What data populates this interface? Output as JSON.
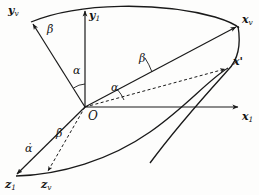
{
  "figure": {
    "kind": "rotation-axes-diagram",
    "background_color": "#fdfdfc",
    "line_color": "#1a1a1a",
    "origin": {
      "label": "O",
      "x": 85,
      "y": 107
    }
  },
  "axes": [
    {
      "id": "y-v",
      "name": "y_v",
      "base": "y",
      "subscript": "v",
      "label_x": 8,
      "label_y": 7,
      "tip_x": 33,
      "tip_y": 24,
      "style": "solid"
    },
    {
      "id": "y-1",
      "name": "y_1",
      "base": "y",
      "subscript": "1",
      "label_x": 90,
      "label_y": 10,
      "tip_x": 85,
      "tip_y": 9,
      "style": "solid"
    },
    {
      "id": "x-v",
      "name": "x_v",
      "base": "x",
      "subscript": "v",
      "label_x": 243,
      "label_y": 15,
      "tip_x": 238,
      "tip_y": 25,
      "style": "solid"
    },
    {
      "id": "x-1",
      "name": "x_1",
      "base": "x",
      "subscript": "1",
      "label_x": 243,
      "label_y": 112,
      "tip_x": 240,
      "tip_y": 107,
      "style": "solid"
    },
    {
      "id": "z-1",
      "name": "z_1",
      "base": "z",
      "subscript": "1",
      "label_x": 6,
      "label_y": 180,
      "tip_x": 15,
      "tip_y": 175,
      "style": "solid"
    },
    {
      "id": "z-v",
      "name": "z_v",
      "base": "z",
      "subscript": "v",
      "label_x": 41,
      "label_y": 180,
      "tip_x": 48,
      "tip_y": 174,
      "style": "dashed"
    }
  ],
  "points": [
    {
      "id": "x-prime",
      "name": "x'",
      "base": "x",
      "accent": "'",
      "label_x": 234,
      "label_y": 58,
      "tip_x": 228,
      "tip_y": 68
    }
  ],
  "angles": [
    {
      "id": "alpha-upper",
      "symbol": "α",
      "label_x": 74,
      "label_y": 68,
      "between": [
        "y_v",
        "y_1"
      ]
    },
    {
      "id": "beta-mid",
      "symbol": "β",
      "label_x": 140,
      "label_y": 58,
      "between": [
        "x-prime-line",
        "x_1-dashed"
      ]
    },
    {
      "id": "alpha-lower",
      "symbol": "α",
      "label_x": 112,
      "label_y": 86,
      "between": [
        "x_1-dashed",
        "x_1"
      ]
    }
  ],
  "rates": [
    {
      "id": "beta-dot-upper",
      "symbol": "β̇",
      "base": "β",
      "label_x": 48,
      "label_y": 26,
      "on_axis": "y_v"
    },
    {
      "id": "alpha-dot-lower",
      "symbol": "α̇",
      "base": "α",
      "label_x": 26,
      "label_y": 145,
      "on_axis": "z_1"
    },
    {
      "id": "beta-dot-lower",
      "symbol": "β̇",
      "base": "β",
      "label_x": 57,
      "label_y": 130,
      "on_axis": "z_v"
    }
  ],
  "arcs": [
    {
      "id": "great-circle-upper",
      "description": "arc from y_v through top to x_v"
    },
    {
      "id": "great-circle-right",
      "description": "arc from x_v down through x' to lower right"
    },
    {
      "id": "great-circle-lower",
      "description": "arc from z_1 through z_v up to x_1 region"
    }
  ]
}
